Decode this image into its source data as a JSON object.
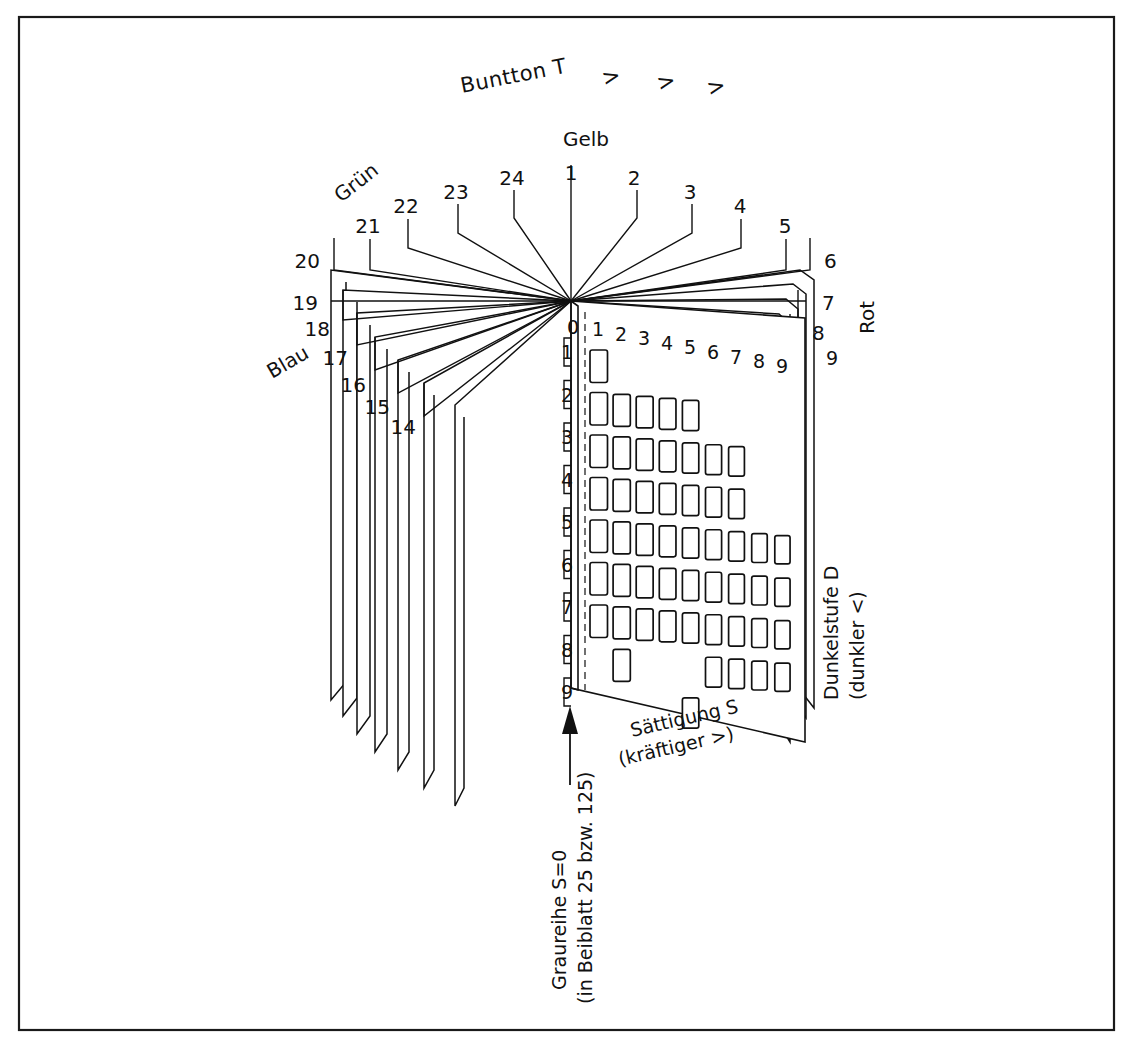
{
  "figure": {
    "title": "Buntton T",
    "title_arrows": [
      ">",
      ">",
      ">"
    ],
    "background_color": "#ffffff",
    "ink_color": "#111111"
  },
  "hue_labels": {
    "yellow": "Gelb",
    "green": "Grün",
    "blue": "Blau",
    "red": "Rot"
  },
  "axes": {
    "saturation": {
      "label": "Sättigung S",
      "sublabel": "(kräftiger >)"
    },
    "darkness": {
      "label": "Dunkelstufe D",
      "sublabel": "(dunkler <)"
    }
  },
  "caption": {
    "line1": "Graureihe S=0",
    "line2": "(in Beiblatt 25 bzw. 125)"
  },
  "page_numbers_right": [
    "1",
    "2",
    "3",
    "4",
    "5",
    "6",
    "7",
    "8",
    "9"
  ],
  "page_numbers_left": [
    "24",
    "23",
    "22",
    "21",
    "20",
    "19",
    "18",
    "17",
    "16",
    "15",
    "14"
  ],
  "front_page_number": "9",
  "column_headers": [
    "0",
    "1",
    "2",
    "3",
    "4",
    "5",
    "6",
    "7",
    "8",
    "9"
  ],
  "row_labels": [
    "1",
    "2",
    "3",
    "4",
    "5",
    "6",
    "7",
    "8",
    "9"
  ],
  "chart_data": {
    "type": "table",
    "title": "Buntton T",
    "xlabel": "Sättigung S (kräftiger >)",
    "ylabel": "Dunkelstufe D (dunkler <)",
    "x_categories": [
      "1",
      "2",
      "3",
      "4",
      "5",
      "6",
      "7",
      "8",
      "9"
    ],
    "y_categories": [
      "1",
      "2",
      "3",
      "4",
      "5",
      "6",
      "7",
      "8",
      "9"
    ],
    "grid": false,
    "legend": "none",
    "swatch_matrix": [
      [
        1,
        0,
        0,
        0,
        0,
        0,
        0,
        0,
        0
      ],
      [
        1,
        1,
        1,
        1,
        1,
        0,
        0,
        0,
        0
      ],
      [
        1,
        1,
        1,
        1,
        1,
        1,
        1,
        0,
        0
      ],
      [
        1,
        1,
        1,
        1,
        1,
        1,
        1,
        0,
        0
      ],
      [
        1,
        1,
        1,
        1,
        1,
        1,
        1,
        1,
        1
      ],
      [
        1,
        1,
        1,
        1,
        1,
        1,
        1,
        1,
        1
      ],
      [
        1,
        1,
        1,
        1,
        1,
        1,
        1,
        1,
        1
      ],
      [
        0,
        1,
        0,
        0,
        0,
        1,
        1,
        1,
        1
      ],
      [
        0,
        0,
        0,
        0,
        1,
        0,
        0,
        0,
        0
      ]
    ],
    "row_counts": [
      1,
      5,
      7,
      7,
      9,
      9,
      9,
      5,
      1
    ],
    "total_swatches": 53
  }
}
